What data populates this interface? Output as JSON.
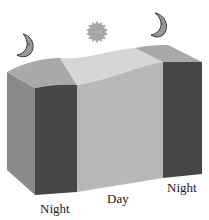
{
  "diagram": {
    "labels": {
      "night_left": "Night",
      "day": "Day",
      "night_right": "Night"
    },
    "icons": {
      "moon_left": "crescent-moon-icon",
      "sun": "sun-icon",
      "moon_right": "crescent-moon-icon"
    },
    "colors": {
      "night_face": "#474747",
      "day_face": "#b8b8b8",
      "side_face": "#8a8a8a",
      "top_day": "#d6d6d6",
      "top_night": "#a9a9a9",
      "sun": "#a8a8a8",
      "moon": "#9a9a9a"
    }
  }
}
